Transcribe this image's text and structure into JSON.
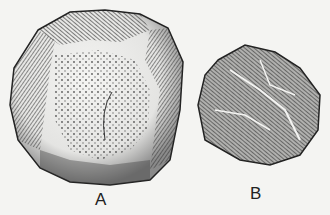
{
  "illustration": {
    "subject": "Two engraved stone tools (flint cores)",
    "figures": [
      {
        "id": "A",
        "label": "A"
      },
      {
        "id": "B",
        "label": "B"
      }
    ]
  },
  "colors": {
    "background": "#f4f4f2",
    "ink": "#2a2a2a",
    "shade": "#555555"
  }
}
